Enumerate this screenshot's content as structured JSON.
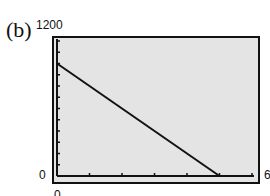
{
  "figure_label": "(b)",
  "axes": {
    "y_max_label": "1200",
    "y_min_label": "0",
    "x_min_label": "0",
    "x_max_label": "6"
  },
  "colors": {
    "plot_background": "#e4e4e4",
    "frame": "#111111",
    "line": "#111111"
  },
  "chart_data": {
    "type": "line",
    "title": "",
    "xlabel": "",
    "ylabel": "",
    "xlim": [
      0,
      6
    ],
    "ylim": [
      0,
      1200
    ],
    "x_tick_step": 1,
    "y_tick_step": 100,
    "grid": false,
    "legend": null,
    "series": [
      {
        "name": "line",
        "x": [
          0,
          5
        ],
        "y": [
          1000,
          0
        ]
      }
    ],
    "annotations": [
      "(b)"
    ]
  }
}
